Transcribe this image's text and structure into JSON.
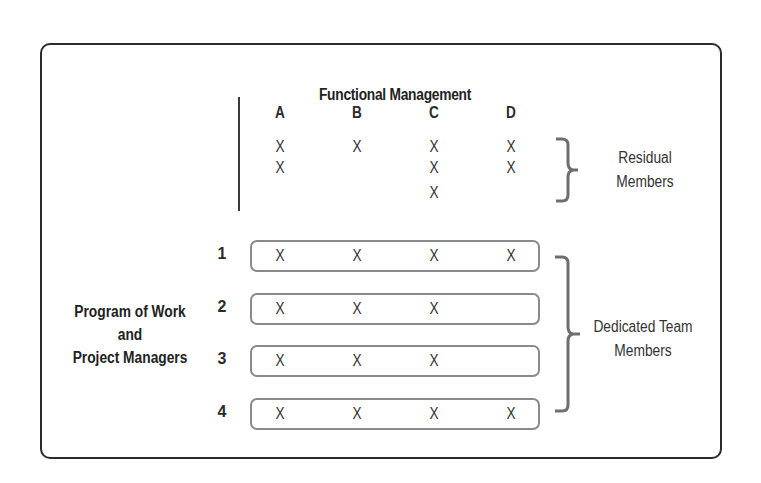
{
  "diagram": {
    "title": "Functional Management",
    "columns": [
      "A",
      "B",
      "C",
      "D"
    ],
    "residual_members": {
      "label_line1": "Residual",
      "label_line2": "Members",
      "counts_by_column": {
        "A": 2,
        "B": 1,
        "C": 3,
        "D": 2
      },
      "mark": "X"
    },
    "program_label": {
      "line1": "Program of Work",
      "line2": "and",
      "line3": "Project Managers"
    },
    "projects": [
      {
        "number": "1",
        "marks": [
          "X",
          "X",
          "X",
          "X"
        ]
      },
      {
        "number": "2",
        "marks": [
          "X",
          "X",
          "X",
          ""
        ]
      },
      {
        "number": "3",
        "marks": [
          "X",
          "X",
          "X",
          ""
        ]
      },
      {
        "number": "4",
        "marks": [
          "X",
          "X",
          "X",
          "X"
        ]
      }
    ],
    "dedicated_members": {
      "label_line1": "Dedicated Team",
      "label_line2": "Members"
    },
    "colors": {
      "frame": "#2b2b2b",
      "row_box_border": "#8a8a8a",
      "brace": "#6e6e6e",
      "text": "#2a2a2a"
    }
  }
}
